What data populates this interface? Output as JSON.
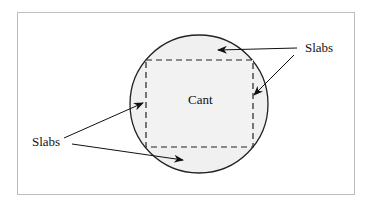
{
  "diagram": {
    "labels": {
      "center": "Cant",
      "right_slabs": "Slabs",
      "left_slabs": "Slabs"
    },
    "colors": {
      "fill": "#f0f0f0",
      "stroke": "#222222",
      "frame": "#bdbdbd"
    }
  }
}
